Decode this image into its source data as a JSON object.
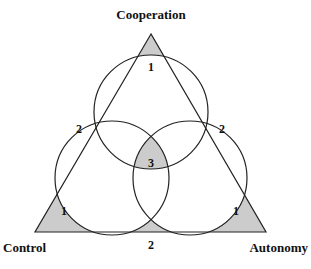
{
  "diagram": {
    "vertices": {
      "top": "Cooperation",
      "left": "Control",
      "right": "Autonomy"
    },
    "regions": {
      "top_corner": "1",
      "left_corner": "1",
      "right_corner": "1",
      "left_edge": "2",
      "right_edge": "2",
      "bottom_edge": "2",
      "center": "3"
    },
    "colors": {
      "fill": "#cccccc",
      "stroke": "#222222",
      "background": "#ffffff"
    }
  }
}
